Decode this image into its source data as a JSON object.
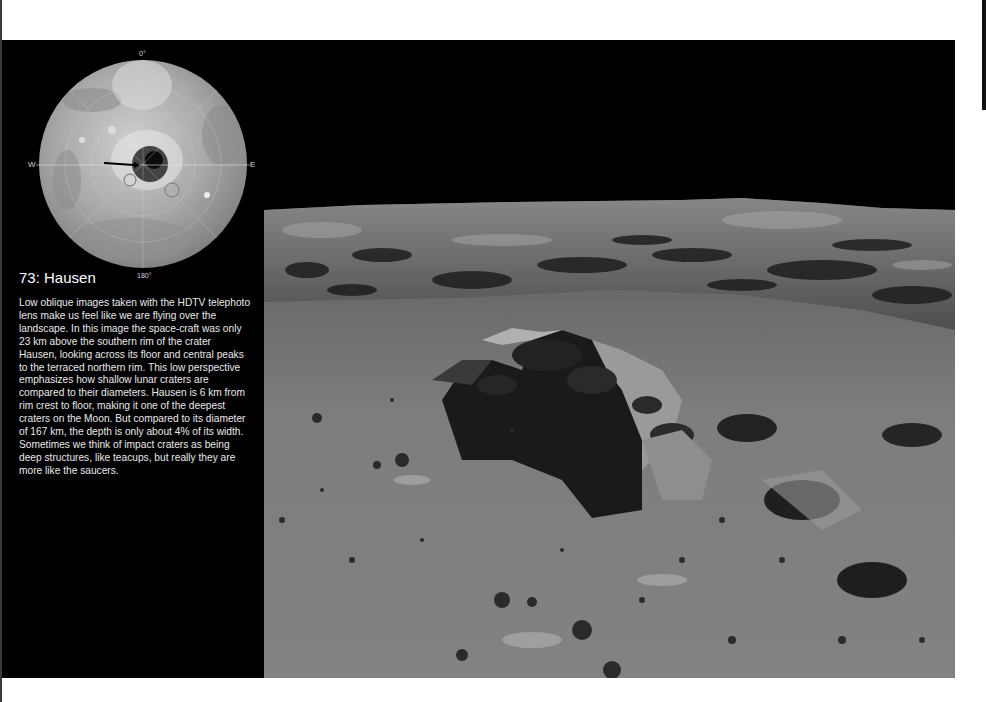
{
  "page": {
    "background": "#ffffff",
    "panel_color": "#000000"
  },
  "locator_map": {
    "labels": {
      "top": "0°",
      "bottom": "180°",
      "left": "W",
      "right": "E"
    },
    "arrow_marker": "site-arrow"
  },
  "caption": {
    "title": "73: Hausen",
    "body": "Low oblique images taken with the HDTV telephoto lens make us feel like we are flying over the landscape. In this image the space-craft was only 23 km above the southern rim of the crater Hausen, looking across its floor and central peaks to the terraced northern rim. This low perspective emphasizes how shallow lunar craters are compared to their diameters. Hausen is 6 km from rim crest to floor, making it one of the deepest craters on the Moon. But compared to its diameter of 167 km, the depth is only about 4% of its width. Sometimes we think of impact craters as being deep structures, like teacups, but really they are more like the saucers."
  },
  "photo": {
    "subject": "Hausen crater floor and central peaks, low oblique view",
    "sky_color": "#000000",
    "surface_color": "#7a7a7a"
  }
}
